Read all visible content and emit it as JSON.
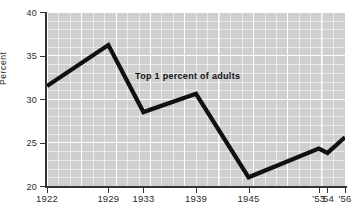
{
  "chart_data": {
    "type": "line",
    "title": "",
    "subtitle": "",
    "xlabel": "",
    "ylabel": "Percent",
    "annotation": "Top 1 percent of adults",
    "grid": true,
    "legend_position": "none",
    "xlim": [
      1922,
      1956
    ],
    "ylim": [
      20,
      40
    ],
    "y_ticks": [
      "40",
      "35",
      "30",
      "25",
      "20"
    ],
    "y_tick_values": [
      40,
      35,
      30,
      25,
      20
    ],
    "x_ticks": [
      "1922",
      "1929",
      "1933",
      "1939",
      "1945",
      "'53",
      "'54",
      "'56"
    ],
    "x_tick_values": [
      1922,
      1929,
      1933,
      1939,
      1945,
      1953,
      1954,
      1956
    ],
    "x": [
      1922,
      1929,
      1933,
      1939,
      1945,
      1953,
      1954,
      1956
    ],
    "values": [
      31.5,
      36.2,
      28.5,
      30.6,
      21.0,
      24.3,
      23.8,
      25.6
    ],
    "series": [
      {
        "name": "Top 1 percent of adults",
        "values": [
          31.5,
          36.2,
          28.5,
          30.6,
          21.0,
          24.3,
          23.8,
          25.6
        ],
        "color": "#111111"
      }
    ]
  },
  "colors": {
    "line": "#111111",
    "plot_background": "#cfcfcf",
    "gridline": "#ffffff",
    "axis": "#333333",
    "text": "#2b2b2b",
    "page_background": "#ffffff"
  }
}
